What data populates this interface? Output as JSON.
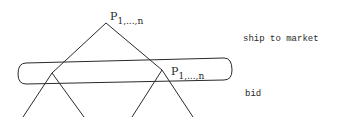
{
  "diagram": {
    "type": "game-tree",
    "root": {
      "label_base": "P",
      "label_sub": "1,...,n"
    },
    "information_set": {
      "node_label_base": "P",
      "node_label_sub": "1,...,n"
    },
    "stage_labels": {
      "top": "ship to market",
      "bottom": "bid"
    },
    "line_color": "#2a2a2a"
  }
}
